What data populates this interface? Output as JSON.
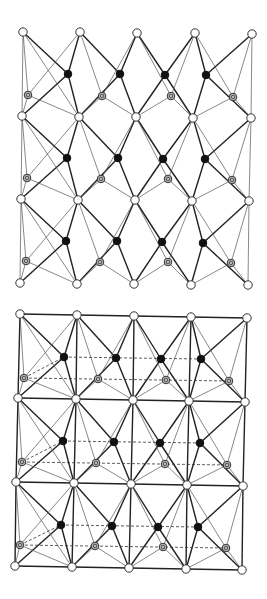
{
  "figure": {
    "panels": [
      {
        "id": "top-lattice",
        "type": "lattice-network",
        "grid_rows": [
          [
            [
              23,
              32
            ],
            [
              80,
              32
            ],
            [
              137,
              33
            ],
            [
              195,
              33
            ],
            [
              252,
              34
            ]
          ],
          [
            [
              22,
              116
            ],
            [
              79,
              117
            ],
            [
              136,
              117
            ],
            [
              193,
              118
            ],
            [
              251,
              118
            ]
          ],
          [
            [
              21,
              199
            ],
            [
              78,
              200
            ],
            [
              135,
              200
            ],
            [
              192,
              201
            ],
            [
              249,
              201
            ]
          ],
          [
            [
              20,
              283
            ],
            [
              77,
              284
            ],
            [
              134,
              284
            ],
            [
              191,
              285
            ],
            [
              248,
              285
            ]
          ]
        ],
        "filled_rows": [
          [
            [
              68,
              74
            ],
            [
              120,
              74
            ],
            [
              165,
              75
            ],
            [
              206,
              75
            ]
          ],
          [
            [
              67,
              158
            ],
            [
              118,
              158
            ],
            [
              163,
              159
            ],
            [
              205,
              159
            ]
          ],
          [
            [
              66,
              241
            ],
            [
              117,
              241
            ],
            [
              162,
              242
            ],
            [
              203,
              243
            ]
          ]
        ],
        "hatched_rows": [
          [
            [
              28,
              95
            ],
            [
              102,
              96
            ],
            [
              171,
              96
            ],
            [
              233,
              97
            ]
          ],
          [
            [
              27,
              178
            ],
            [
              101,
              179
            ],
            [
              168,
              179
            ],
            [
              232,
              180
            ]
          ],
          [
            [
              26,
              261
            ],
            [
              100,
              262
            ],
            [
              168,
              262
            ],
            [
              231,
              263
            ]
          ]
        ],
        "horizontal_frame": false,
        "dashed_links": false
      },
      {
        "id": "bottom-lattice",
        "type": "lattice-network",
        "grid_rows": [
          [
            [
              20,
              314
            ],
            [
              77,
              315
            ],
            [
              134,
              316
            ],
            [
              191,
              317
            ],
            [
              247,
              318
            ]
          ],
          [
            [
              18,
              398
            ],
            [
              76,
              399
            ],
            [
              133,
              400
            ],
            [
              189,
              401
            ],
            [
              245,
              402
            ]
          ],
          [
            [
              16,
              482
            ],
            [
              74,
              483
            ],
            [
              131,
              484
            ],
            [
              187,
              485
            ],
            [
              243,
              486
            ]
          ],
          [
            [
              15,
              566
            ],
            [
              72,
              567
            ],
            [
              129,
              568
            ],
            [
              186,
              569
            ],
            [
              242,
              570
            ]
          ]
        ],
        "filled_rows": [
          [
            [
              64,
              357
            ],
            [
              116,
              358
            ],
            [
              161,
              359
            ],
            [
              201,
              359
            ]
          ],
          [
            [
              63,
              441
            ],
            [
              114,
              442
            ],
            [
              160,
              443
            ],
            [
              200,
              443
            ]
          ],
          [
            [
              61,
              525
            ],
            [
              112,
              526
            ],
            [
              158,
              527
            ],
            [
              198,
              527
            ]
          ]
        ],
        "hatched_rows": [
          [
            [
              24,
              378
            ],
            [
              98,
              379
            ],
            [
              166,
              380
            ],
            [
              229,
              381
            ]
          ],
          [
            [
              22,
              462
            ],
            [
              96,
              463
            ],
            [
              165,
              464
            ],
            [
              227,
              465
            ]
          ],
          [
            [
              20,
              545
            ],
            [
              95,
              546
            ],
            [
              163,
              547
            ],
            [
              226,
              548
            ]
          ]
        ],
        "horizontal_frame": true,
        "dashed_links": true
      }
    ],
    "legend_node_types": [
      "open-circle",
      "filled-circle",
      "hatched-circle"
    ]
  }
}
